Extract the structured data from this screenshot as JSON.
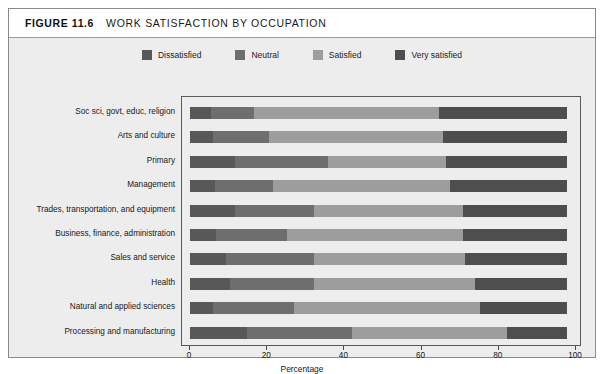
{
  "figure": {
    "number": "FIGURE 11.6",
    "title": "WORK SATISFACTION BY OCCUPATION"
  },
  "legend": {
    "items": [
      {
        "label": "Dissatisfied",
        "color": "#585858"
      },
      {
        "label": "Neutral",
        "color": "#6e6e6e"
      },
      {
        "label": "Satisfied",
        "color": "#9d9d9d"
      },
      {
        "label": "Very satisfied",
        "color": "#4e4e4e"
      }
    ]
  },
  "chart_data": {
    "type": "bar",
    "orientation": "horizontal",
    "stacked": true,
    "stacked_percent": true,
    "title": "WORK SATISFACTION BY OCCUPATION",
    "xlabel": "Percentage",
    "ylabel": "",
    "xlim": [
      0,
      100
    ],
    "xticks": [
      0,
      20,
      40,
      60,
      80,
      100
    ],
    "grid": false,
    "legend_position": "top-center",
    "categories": [
      "Soc sci, govt, educ, religion",
      "Arts and culture",
      "Primary",
      "Management",
      "Trades, transportation, and equipment",
      "Business, finance, administration",
      "Sales and service",
      "Health",
      "Natural and applied sciences",
      "Processing and manufacturing"
    ],
    "series": [
      {
        "name": "Dissatisfied",
        "color": "#585858",
        "values": [
          5.5,
          6.0,
          12.0,
          6.5,
          12.0,
          7.0,
          9.5,
          10.5,
          6.0,
          15.0
        ]
      },
      {
        "name": "Neutral",
        "color": "#6e6e6e",
        "values": [
          11.5,
          15.0,
          24.5,
          15.5,
          21.0,
          18.7,
          23.5,
          22.5,
          21.5,
          28.0
        ]
      },
      {
        "name": "Satisfied",
        "color": "#9d9d9d",
        "values": [
          49.0,
          46.0,
          31.5,
          47.0,
          39.5,
          46.8,
          40.0,
          42.5,
          49.5,
          41.0
        ]
      },
      {
        "name": "Very satisfied",
        "color": "#4e4e4e",
        "values": [
          34.0,
          33.0,
          32.0,
          31.0,
          27.5,
          27.5,
          27.0,
          24.5,
          23.0,
          16.0
        ]
      }
    ],
    "cumulative_boundaries": [
      [
        5.5,
        17.0,
        66.0,
        100
      ],
      [
        6.0,
        21.0,
        67.0,
        100
      ],
      [
        12.0,
        36.5,
        68.0,
        100
      ],
      [
        6.5,
        22.0,
        69.0,
        100
      ],
      [
        12.0,
        33.0,
        72.5,
        100
      ],
      [
        7.0,
        25.7,
        72.5,
        100
      ],
      [
        9.5,
        33.0,
        73.0,
        100
      ],
      [
        10.5,
        33.0,
        75.5,
        100
      ],
      [
        6.0,
        27.5,
        77.0,
        100
      ],
      [
        15.0,
        43.0,
        84.0,
        100
      ]
    ]
  }
}
